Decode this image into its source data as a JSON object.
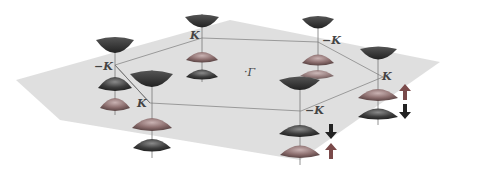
{
  "diagram": {
    "type": "brillouin-zone-valley-cones",
    "center_label": "·Γ",
    "valleys": [
      {
        "id": "v1",
        "label": "−K",
        "x": 113,
        "y": 65
      },
      {
        "id": "v2",
        "label": "K",
        "x": 202,
        "y": 36
      },
      {
        "id": "v3",
        "label": "−K",
        "x": 318,
        "y": 40
      },
      {
        "id": "v4",
        "label": "K",
        "x": 383,
        "y": 77
      },
      {
        "id": "v5",
        "label": "−K",
        "x": 301,
        "y": 111
      },
      {
        "id": "v6",
        "label": "K",
        "x": 150,
        "y": 103
      }
    ],
    "spin_arrows": [
      {
        "id": "a1",
        "direction": "up",
        "color": "#7a4a4a",
        "x": 405,
        "y": 92
      },
      {
        "id": "a2",
        "direction": "down",
        "color": "#222222",
        "x": 405,
        "y": 112
      },
      {
        "id": "a3",
        "direction": "down",
        "color": "#222222",
        "x": 331,
        "y": 132
      },
      {
        "id": "a4",
        "direction": "up",
        "color": "#7a4a4a",
        "x": 331,
        "y": 152
      }
    ],
    "colors": {
      "plane": "#d9d9d9",
      "hexagon": "#9a9a9a",
      "conduction_band": "#3a3a3a",
      "band_red": "#8a6a6a",
      "band_dark": "#4a4a4a"
    }
  }
}
